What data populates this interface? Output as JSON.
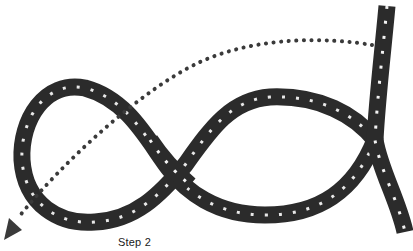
{
  "figure": {
    "caption": "Step 2",
    "colors": {
      "background": "#ffffff",
      "rope": "#2b2b2b",
      "rope_flecks": "#f2f2f2",
      "guide_line": "#3a3a3a"
    },
    "elements": [
      {
        "type": "rope",
        "description": "Dark braided rope with white flecks forming a figure-eight loop"
      },
      {
        "type": "dotted-arrow",
        "description": "Dotted guide path from top-right rope end curving left and down to an arrowhead at bottom-left"
      }
    ]
  }
}
